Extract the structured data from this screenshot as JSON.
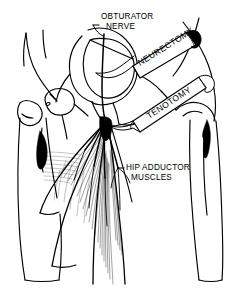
{
  "figure": {
    "background_color": "#ffffff",
    "ink_color": "#000000",
    "width": 243,
    "height": 289
  },
  "annotations": {
    "obturator_nerve": {
      "line1": "OBTURATOR",
      "line2": "NERVE"
    },
    "hip_adductor": {
      "line1": "HIP ADDUCTOR",
      "line2": "MUSCLES"
    }
  },
  "instruments": [
    {
      "id": "neurectomy",
      "label": "NEURECTOMY",
      "angle": -22
    },
    {
      "id": "tenotomy",
      "label": "TENOTOMY",
      "angle": -25
    }
  ],
  "structures": [
    {
      "id": "left-femur",
      "label": "left femur"
    },
    {
      "id": "right-femur",
      "label": "right femur"
    },
    {
      "id": "pelvis-obturator-ring",
      "label": "obturator foramen"
    },
    {
      "id": "adductor-muscle-fan",
      "label": "adductor muscle fan"
    },
    {
      "id": "obturator-nerve-branches",
      "label": "obturator nerve branches"
    }
  ]
}
